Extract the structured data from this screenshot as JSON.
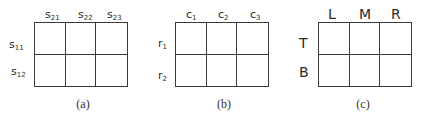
{
  "panels": [
    {
      "caption": "(a)",
      "columns": [
        {
          "base": "s",
          "sub": "21"
        },
        {
          "base": "s",
          "sub": "22"
        },
        {
          "base": "s",
          "sub": "23"
        }
      ],
      "rows": [
        {
          "base": "s",
          "sub": "11"
        },
        {
          "base": "s",
          "sub": "12"
        }
      ]
    },
    {
      "caption": "(b)",
      "columns": [
        {
          "base": "c",
          "sub": "1"
        },
        {
          "base": "c",
          "sub": "2"
        },
        {
          "base": "c",
          "sub": "3"
        }
      ],
      "rows": [
        {
          "base": "r",
          "sub": "1"
        },
        {
          "base": "r",
          "sub": "2"
        }
      ]
    },
    {
      "caption": "(c)",
      "columns": [
        {
          "base": "L"
        },
        {
          "base": "M"
        },
        {
          "base": "R"
        }
      ],
      "rows": [
        {
          "base": "T"
        },
        {
          "base": "B"
        }
      ]
    }
  ],
  "colors": {
    "line": "#3a3a3a",
    "text": "#2a2a2a",
    "background": "#ffffff"
  }
}
